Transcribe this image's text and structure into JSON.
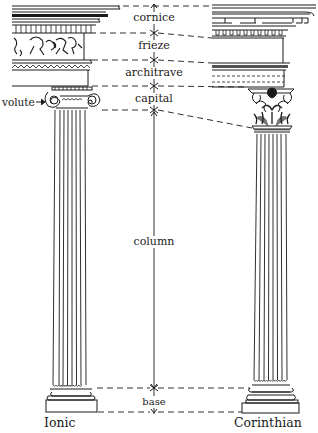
{
  "diagram": {
    "columns": [
      {
        "name": "Ionic",
        "label": "Ionic"
      },
      {
        "name": "Corinthian",
        "label": "Corinthian"
      }
    ],
    "parts": [
      {
        "id": "cornice",
        "label": "cornice"
      },
      {
        "id": "frieze",
        "label": "frieze"
      },
      {
        "id": "architrave",
        "label": "architrave"
      },
      {
        "id": "capital",
        "label": "capital"
      },
      {
        "id": "column",
        "label": "column"
      },
      {
        "id": "base",
        "label": "base"
      }
    ],
    "callout": {
      "label": "volute"
    },
    "colors": {
      "ink": "#1a1a1a",
      "background": "#ffffff"
    }
  }
}
